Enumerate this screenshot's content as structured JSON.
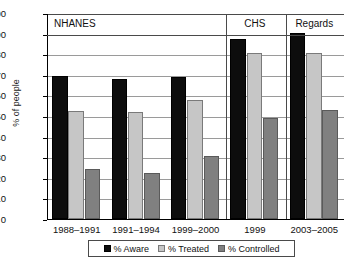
{
  "chart_data": {
    "type": "bar",
    "title": "",
    "xlabel": "",
    "ylabel": "% of people",
    "ylim": [
      0,
      100
    ],
    "ytick_step": 10,
    "grid": true,
    "legend_position": "bottom",
    "categories": [
      "1988–1991",
      "1991–1994",
      "1999–2000",
      "1999",
      "2003–2005"
    ],
    "series": [
      {
        "name": "% Aware",
        "color": "#0d0d0d",
        "values": [
          69.5,
          68.0,
          69.0,
          87.5,
          90.5
        ]
      },
      {
        "name": "% Treated",
        "color": "#c6c6c6",
        "values": [
          52.5,
          52.0,
          58.0,
          80.5,
          80.5
        ]
      },
      {
        "name": "% Controlled",
        "color": "#808080",
        "values": [
          24.5,
          22.5,
          30.5,
          49.0,
          53.0
        ]
      }
    ],
    "ytick_labels": [
      "100",
      "90",
      "80",
      "70",
      "60",
      "50",
      "40",
      "30",
      "20",
      "10",
      "0"
    ],
    "sections": [
      {
        "label": "NHANES",
        "categories": [
          "1988–1991",
          "1991–1994",
          "1999–2000"
        ]
      },
      {
        "label": "CHS",
        "categories": [
          "1999"
        ]
      },
      {
        "label": "Regards",
        "categories": [
          "2003–2005"
        ]
      }
    ]
  },
  "colors": {
    "aware": "#0d0d0d",
    "treated": "#c6c6c6",
    "controlled": "#808080",
    "axis": "#000000",
    "gridline": "#9a9a9a",
    "background": "#ffffff"
  }
}
